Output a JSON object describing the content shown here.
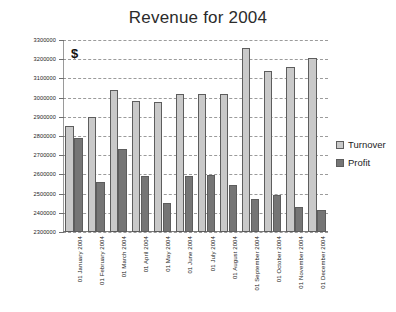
{
  "chart_data": {
    "type": "bar",
    "title": "Revenue for 2004",
    "xlabel": "",
    "ylabel": "",
    "unit_annotation": "$",
    "ylim": [
      2300000,
      3300000
    ],
    "ytick_step": 100000,
    "grid": true,
    "legend_position": "right",
    "categories": [
      "01 January 2004",
      "01 February 2004",
      "01 March 2004",
      "01 April 2004",
      "01 May 2004",
      "01 June 2004",
      "01 July 2004",
      "01 August 2004",
      "01 September 2004",
      "01 October 2004",
      "01 November 2004",
      "01 December 2004"
    ],
    "ytick_labels": [
      "3300000",
      "3200000",
      "3100000",
      "3000000",
      "2900000",
      "2800000",
      "2700000",
      "2600000",
      "2500000",
      "2400000",
      "2300000"
    ],
    "series": [
      {
        "name": "Turnover",
        "color": "#c9c9c9",
        "values": [
          2850000,
          2900000,
          3040000,
          2980000,
          2975000,
          3020000,
          3020000,
          3020000,
          3260000,
          3140000,
          3160000,
          3205000
        ]
      },
      {
        "name": "Profit",
        "color": "#757575",
        "values": [
          2790000,
          2560000,
          2730000,
          2590000,
          2450000,
          2590000,
          2595000,
          2545000,
          2470000,
          2495000,
          2430000,
          2415000
        ]
      }
    ]
  },
  "legend": {
    "items": [
      {
        "label": "Turnover",
        "color": "#c9c9c9"
      },
      {
        "label": "Profit",
        "color": "#757575"
      }
    ]
  }
}
